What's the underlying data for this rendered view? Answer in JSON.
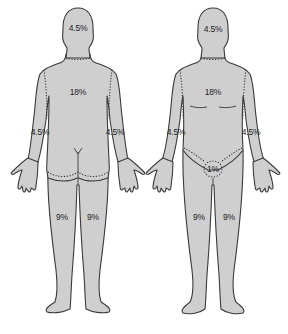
{
  "diagram": {
    "title": "",
    "views": [
      {
        "name": "back",
        "labels": {
          "head": "4.5%",
          "trunk": "18%",
          "left_arm": "4.5%",
          "right_arm": "4.5%",
          "left_leg": "9%",
          "right_leg": "9%"
        }
      },
      {
        "name": "front",
        "labels": {
          "head": "4.5%",
          "trunk": "18%",
          "left_arm": "4.5%",
          "right_arm": "4.5%",
          "genitalia": "1%",
          "left_leg": "9%",
          "right_leg": "9%"
        }
      }
    ],
    "colors": {
      "skin_fill": "#cfcfcf",
      "outline": "#3a3a3a",
      "background": "#ffffff"
    }
  }
}
